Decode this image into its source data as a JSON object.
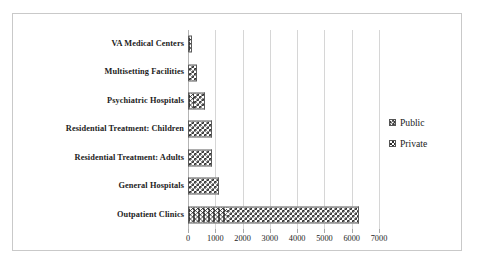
{
  "chart_data": {
    "type": "bar",
    "orientation": "horizontal",
    "stacked": true,
    "title": "",
    "xlabel": "",
    "ylabel": "",
    "xlim": [
      0,
      7000
    ],
    "xticks": [
      0,
      1000,
      2000,
      3000,
      4000,
      5000,
      6000,
      7000
    ],
    "xtick_labels": [
      "0",
      "1000",
      "2000",
      "3000",
      "4000",
      "5000",
      "6000",
      "7000"
    ],
    "grid": true,
    "legend_position": "right",
    "categories": [
      "VA Medical Centers",
      "Multisetting Facilities",
      "Psychiatric Hospitals",
      "Residential Treatment: Children",
      "Residential Treatment: Adults",
      "General Hospitals",
      "Outpatient Clinics"
    ],
    "series": [
      {
        "name": "Public",
        "pattern": "wavy",
        "values": [
          160,
          0,
          220,
          30,
          40,
          30,
          1430
        ]
      },
      {
        "name": "Private",
        "pattern": "checkerboard",
        "values": [
          0,
          330,
          390,
          840,
          840,
          1100,
          4830
        ]
      }
    ],
    "totals": [
      160,
      330,
      610,
      870,
      880,
      1130,
      6260
    ]
  },
  "legend": {
    "entries": [
      {
        "label": "Public",
        "swatch": "wavy-swatch-icon"
      },
      {
        "label": "Private",
        "swatch": "checkerboard-swatch-icon"
      }
    ]
  },
  "colors": {
    "frame_border": "#c9c9c9",
    "gridline": "#d6d6d6",
    "axis": "#b4b4b4",
    "bar_outline": "#5a5a5a",
    "pattern_ink": "#2e2e2e",
    "text": "#1c1c1c",
    "background": "#ffffff"
  }
}
